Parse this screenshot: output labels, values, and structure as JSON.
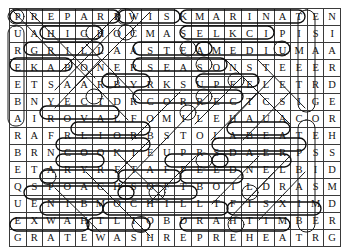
{
  "puzzle": {
    "kind": "word-search-grid",
    "rows": 14,
    "columns": 20,
    "ink_color": "#111111",
    "grid_line_color": "#3a3a3a",
    "annotation_color": "#0d0d0d",
    "grid": [
      [
        "P",
        "R",
        "E",
        "P",
        "A",
        "R",
        "E",
        "W",
        "I",
        "S",
        "K",
        "M",
        "A",
        "R",
        "I",
        "N",
        "A",
        "T",
        "E",
        "N"
      ],
      [
        "U",
        "A",
        "H",
        "I",
        "G",
        "H",
        "O",
        "C",
        "M",
        "A",
        "S",
        "E",
        "L",
        "K",
        "C",
        "I",
        "P",
        "I",
        "S",
        "I"
      ],
      [
        "R",
        "G",
        "R",
        "I",
        "L",
        "L",
        "A",
        "A",
        "S",
        "T",
        "E",
        "A",
        "M",
        "E",
        "D",
        "I",
        "U",
        "M",
        "A",
        "A"
      ],
      [
        "E",
        "K",
        "A",
        "B",
        "O",
        "N",
        "E",
        "R",
        "S",
        "E",
        "A",
        "S",
        "O",
        "N",
        "S",
        "T",
        "E",
        "E",
        "E",
        "R"
      ],
      [
        "E",
        "T",
        "S",
        "A",
        "A",
        "R",
        "B",
        "Y",
        "R",
        "K",
        "S",
        "U",
        "P",
        "E",
        "E",
        "L",
        "E",
        "T",
        "R",
        "D"
      ],
      [
        "B",
        "N",
        "Y",
        "E",
        "C",
        "T",
        "D",
        "R",
        "C",
        "O",
        "R",
        "R",
        "E",
        "C",
        "T",
        "C",
        "S",
        "I",
        "G",
        "E"
      ],
      [
        "A",
        "I",
        "R",
        "O",
        "V",
        "A",
        "L",
        "F",
        "O",
        "M",
        "I",
        "L",
        "E",
        "H",
        "A",
        "U",
        "A",
        "C",
        "O",
        "R"
      ],
      [
        "R",
        "A",
        "F",
        "R",
        "L",
        "I",
        "O",
        "R",
        "B",
        "S",
        "T",
        "O",
        "L",
        "A",
        "B",
        "E",
        "A",
        "T",
        "E",
        "H"
      ],
      [
        "B",
        "R",
        "N",
        "C",
        "O",
        "O",
        "K",
        "I",
        "E",
        "U",
        "P",
        "R",
        "S",
        "D",
        "A",
        "E",
        "R",
        "P",
        "S",
        "S"
      ],
      [
        "E",
        "T",
        "A",
        "R",
        "Y",
        "R",
        "F",
        "T",
        "A",
        "F",
        "P",
        "E",
        "E",
        "D",
        "N",
        "E",
        "L",
        "B",
        "I",
        "D"
      ],
      [
        "Q",
        "S",
        "P",
        "O",
        "A",
        "C",
        "H",
        "S",
        "O",
        "F",
        "T",
        "B",
        "O",
        "I",
        "L",
        "D",
        "R",
        "A",
        "S",
        "M"
      ],
      [
        "U",
        "E",
        "N",
        "I",
        "B",
        "M",
        "O",
        "C",
        "H",
        "I",
        "L",
        "L",
        "T",
        "F",
        "I",
        "S",
        "X",
        "I",
        "M",
        "D"
      ],
      [
        "E",
        "X",
        "W",
        "A",
        "H",
        "T",
        "L",
        "I",
        "O",
        "B",
        "D",
        "R",
        "A",
        "H",
        "T",
        "I",
        "M",
        "B",
        "E",
        "R"
      ],
      [
        "G",
        "R",
        "A",
        "T",
        "E",
        "W",
        "A",
        "S",
        "H",
        "R",
        "E",
        "P",
        "R",
        "E",
        "H",
        "E",
        "A",
        "T",
        "R",
        "G"
      ]
    ],
    "found_words": [
      "PREPARE",
      "WISK",
      "MARINATE",
      "HIGH",
      "PICKLES",
      "GRILL",
      "STEAM",
      "MEDIUM",
      "BAKE",
      "SEASON",
      "DRY",
      "PEEL",
      "CORRECT",
      "ROVAL",
      "BROIL",
      "BEAT",
      "COOKIE",
      "SPREAD",
      "FRY",
      "DEEP",
      "BLEND",
      "POACH",
      "SOFT BOIL",
      "COMBINE",
      "CHILL",
      "THAW",
      "HARD BOIL",
      "TIMBER",
      "GRATE",
      "WASH",
      "PREHEAT"
    ]
  }
}
